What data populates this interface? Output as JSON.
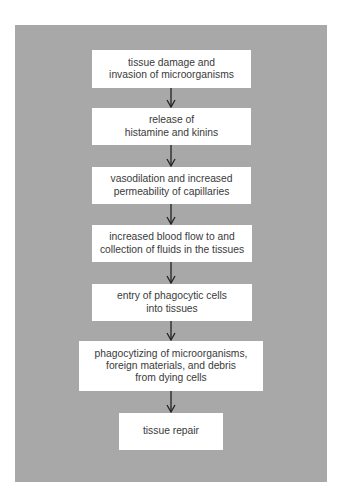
{
  "diagram": {
    "type": "flowchart",
    "direction": "top-to-bottom",
    "colors": {
      "panel_background": "#a8a8a8",
      "box_background": "#ffffff",
      "text": "#3a3a3a",
      "arrow": "#222222"
    },
    "steps": [
      {
        "label": "tissue damage and\ninvasion of microorganisms"
      },
      {
        "label": "release of\nhistamine and kinins"
      },
      {
        "label": "vasodilation and increased\npermeability of capillaries"
      },
      {
        "label": "increased blood flow to and\ncollection of fluids in the tissues"
      },
      {
        "label": "entry of phagocytic cells\ninto tissues"
      },
      {
        "label": "phagocytizing of microorganisms,\nforeign materials, and debris\nfrom dying cells"
      },
      {
        "label": "tissue repair"
      }
    ],
    "connections": [
      {
        "from": 0,
        "to": 1,
        "icon": "arrow-down-icon"
      },
      {
        "from": 1,
        "to": 2,
        "icon": "arrow-down-icon"
      },
      {
        "from": 2,
        "to": 3,
        "icon": "arrow-down-icon"
      },
      {
        "from": 3,
        "to": 4,
        "icon": "arrow-down-icon"
      },
      {
        "from": 4,
        "to": 5,
        "icon": "arrow-down-icon"
      },
      {
        "from": 5,
        "to": 6,
        "icon": "arrow-down-icon"
      }
    ]
  }
}
